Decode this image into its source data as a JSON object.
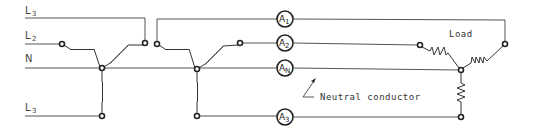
{
  "diagram": {
    "type": "three-phase four-wire wye circuit with ammeters",
    "lines": [
      {
        "id": "L3_top",
        "letter": "L",
        "sub": "3"
      },
      {
        "id": "L2",
        "letter": "L",
        "sub": "2"
      },
      {
        "id": "N",
        "letter": "N",
        "sub": ""
      },
      {
        "id": "L3_bottom",
        "letter": "L",
        "sub": "3"
      }
    ],
    "ammeters": [
      {
        "id": "A1",
        "letter": "A",
        "sub": "1"
      },
      {
        "id": "A2",
        "letter": "A",
        "sub": "2"
      },
      {
        "id": "AN",
        "letter": "A",
        "sub": "N"
      },
      {
        "id": "A3",
        "letter": "A",
        "sub": "3"
      }
    ],
    "labels": {
      "load": "Load",
      "neutral_conductor": "Neutral conductor"
    },
    "colors": {
      "line": "#555555",
      "ink": "#222222",
      "background": "#ffffff"
    }
  }
}
